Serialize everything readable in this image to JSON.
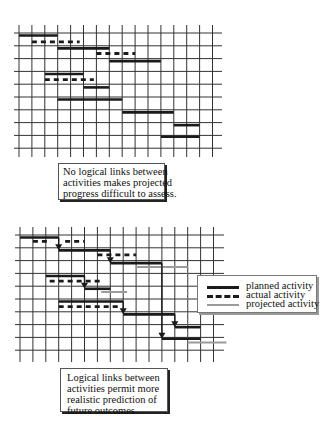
{
  "diagrams": [
    {
      "id": "unlinked",
      "linked": false,
      "caption": [
        "No logical links between",
        "activities makes projected",
        "progress difficult to assess."
      ],
      "grid": {
        "columns": 15,
        "rows": 10
      },
      "bars": [
        {
          "type": "planned",
          "row": 0.2,
          "start": 0,
          "end": 3
        },
        {
          "type": "actual",
          "row": 0.7,
          "start": 1,
          "end": 4.7
        },
        {
          "type": "planned",
          "row": 1.2,
          "start": 3,
          "end": 7
        },
        {
          "type": "actual",
          "row": 1.6,
          "start": 6,
          "end": 9
        },
        {
          "type": "planned",
          "row": 2.2,
          "start": 7,
          "end": 11
        },
        {
          "type": "planned",
          "row": 3.2,
          "start": 2,
          "end": 5
        },
        {
          "type": "actual",
          "row": 3.65,
          "start": 2,
          "end": 5.8
        },
        {
          "type": "planned",
          "row": 4.25,
          "start": 5,
          "end": 7
        },
        {
          "type": "planned",
          "row": 5.2,
          "start": 3,
          "end": 8
        },
        {
          "type": "planned",
          "row": 6.2,
          "start": 8,
          "end": 12
        },
        {
          "type": "planned",
          "row": 7.2,
          "start": 12,
          "end": 14
        },
        {
          "type": "planned",
          "row": 8.1,
          "start": 11,
          "end": 14
        }
      ]
    },
    {
      "id": "linked",
      "linked": true,
      "caption": [
        "Logical links between",
        "activities permit more",
        "realistic prediction of",
        "future outcomes."
      ],
      "grid": {
        "columns": 15,
        "rows": 10
      },
      "bars": [
        {
          "type": "planned",
          "row": 0.2,
          "start": 0,
          "end": 3
        },
        {
          "type": "actual",
          "row": 0.5,
          "start": 1,
          "end": 2.4
        },
        {
          "type": "actual",
          "row": 0.5,
          "start": 3.5,
          "end": 5
        },
        {
          "type": "planned",
          "row": 1.2,
          "start": 3,
          "end": 7
        },
        {
          "type": "actual",
          "row": 1.55,
          "start": 6,
          "end": 9
        },
        {
          "type": "planned",
          "row": 2.2,
          "start": 7,
          "end": 11
        },
        {
          "type": "projected",
          "row": 2.5,
          "start": 9,
          "end": 13
        },
        {
          "type": "planned",
          "row": 3.2,
          "start": 2,
          "end": 5
        },
        {
          "type": "actual",
          "row": 3.6,
          "start": 2.3,
          "end": 6.2
        },
        {
          "type": "planned",
          "row": 4.2,
          "start": 5,
          "end": 7
        },
        {
          "type": "projected",
          "row": 4.45,
          "start": 6.3,
          "end": 8.3
        },
        {
          "type": "planned",
          "row": 5.2,
          "start": 3,
          "end": 8
        },
        {
          "type": "actual",
          "row": 5.6,
          "start": 3,
          "end": 7.8
        },
        {
          "type": "planned",
          "row": 6.2,
          "start": 8,
          "end": 12
        },
        {
          "type": "planned",
          "row": 7.2,
          "start": 12,
          "end": 14
        },
        {
          "type": "planned",
          "row": 8.1,
          "start": 11,
          "end": 14
        },
        {
          "type": "projected",
          "row": 8.4,
          "start": 13,
          "end": 16
        }
      ],
      "links": [
        {
          "col": 3,
          "from": 0.2,
          "to": 1.2
        },
        {
          "col": 7,
          "from": 1.2,
          "to": 2.2
        },
        {
          "col": 5,
          "from": 3.2,
          "to": 4.2
        },
        {
          "col": 8,
          "from": 5.2,
          "to": 6.2
        },
        {
          "col": 12,
          "from": 6.2,
          "to": 7.2
        },
        {
          "col": 11,
          "from": 2.2,
          "to": 8.1
        }
      ],
      "projection_line": {
        "col": 13,
        "from": 2.5,
        "to": 8.4
      }
    }
  ],
  "legend": {
    "items": [
      {
        "type": "planned",
        "label": "planned activity"
      },
      {
        "type": "actual",
        "label": "actual activity"
      },
      {
        "type": "projected",
        "label": "projected activity"
      }
    ]
  },
  "colors": {
    "planned": "#1a1a1a",
    "actual": "#1a1a1a",
    "projected": "#9a9a9a",
    "grid": "#333333"
  }
}
